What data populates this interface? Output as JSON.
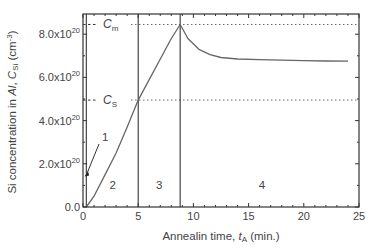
{
  "chart_data": {
    "type": "line",
    "title": "",
    "xlabel": "Annealin time, t_A (min.)",
    "xlabel_parts": {
      "pre": "Annealin time, ",
      "var": "t",
      "sub": "A",
      "post": " (min.)"
    },
    "ylabel": "Si concentration in Al, C_Si (cm^-3)",
    "ylabel_parts": {
      "pre": "Si concentration in ",
      "al": "Al",
      "comma": ", ",
      "var": "C",
      "sub": "Si",
      "post": " (cm",
      "sup": "-3",
      "end": ")"
    },
    "xlim": [
      0,
      25
    ],
    "ylim": [
      0,
      9e+20
    ],
    "x_ticks": [
      "0",
      "5",
      "10",
      "15",
      "20",
      "25"
    ],
    "y_ticks": [
      {
        "value": 0.0,
        "mant": "0.0",
        "exp": ""
      },
      {
        "value": 2e+20,
        "mant": "2.0x10",
        "exp": "20"
      },
      {
        "value": 4e+20,
        "mant": "4.0x10",
        "exp": "20"
      },
      {
        "value": 6e+20,
        "mant": "6.0x10",
        "exp": "20"
      },
      {
        "value": 8e+20,
        "mant": "8.0x10",
        "exp": "20"
      }
    ],
    "grid": false,
    "series": [
      {
        "name": "C_Si",
        "x": [
          0.3,
          1,
          2,
          3,
          4,
          5,
          6,
          7,
          8,
          8.8,
          9.5,
          10.5,
          11.5,
          12.5,
          14,
          16,
          18,
          20,
          22,
          24
        ],
        "values": [
          0.0,
          5e+19,
          1.5e+20,
          2.5e+20,
          3.7e+20,
          4.95e+20,
          5.9e+20,
          6.85e+20,
          7.8e+20,
          8.45e+20,
          7.8e+20,
          7.3e+20,
          7.05e+20,
          6.92e+20,
          6.85e+20,
          6.82e+20,
          6.8e+20,
          6.78e+20,
          6.76e+20,
          6.75e+20
        ]
      }
    ],
    "reference_lines": [
      {
        "label": "C_m",
        "var": "C",
        "sub": "m",
        "value": 8.45e+20,
        "style": "dashed"
      },
      {
        "label": "C_S",
        "var": "C",
        "sub": "S",
        "value": 4.95e+20,
        "style": "dashed"
      }
    ],
    "region_boundaries": [
      0.3,
      5,
      8.8
    ],
    "regions": [
      {
        "label": "1",
        "x": 0.15
      },
      {
        "label": "2",
        "x": 2.7
      },
      {
        "label": "3",
        "x": 6.9
      },
      {
        "label": "4",
        "x": 16.2
      }
    ],
    "annotations": [
      {
        "text": "1",
        "points_to": [
          0.1,
          1.5e+20
        ]
      }
    ]
  }
}
